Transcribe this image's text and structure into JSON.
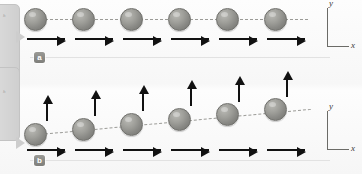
{
  "figure": {
    "background_color": "#fbfbfb",
    "ball_color": "#8a8a86",
    "arrow_color": "#111111",
    "axis_color": "#6b6b67",
    "trajectory_color": "#9b9b97",
    "badge_color": "#7e7e7a"
  },
  "launcher": {
    "label": "h"
  },
  "panels": [
    {
      "id": "a",
      "badge_label": "a",
      "axes": {
        "x_label": "x",
        "y_label": "y"
      },
      "trajectory": {
        "style": "dashed",
        "slope": "horizontal"
      },
      "balls": [
        {
          "index": 1,
          "x": 24,
          "y": 8
        },
        {
          "index": 2,
          "x": 72,
          "y": 8
        },
        {
          "index": 3,
          "x": 120,
          "y": 8
        },
        {
          "index": 4,
          "x": 168,
          "y": 8
        },
        {
          "index": 5,
          "x": 216,
          "y": 8
        },
        {
          "index": 6,
          "x": 264,
          "y": 8
        }
      ],
      "horizontal_arrows": [
        {
          "index": 1,
          "x": 27,
          "y": 38,
          "length": 38
        },
        {
          "index": 2,
          "x": 75,
          "y": 38,
          "length": 38
        },
        {
          "index": 3,
          "x": 123,
          "y": 38,
          "length": 38
        },
        {
          "index": 4,
          "x": 171,
          "y": 38,
          "length": 38
        },
        {
          "index": 5,
          "x": 219,
          "y": 38,
          "length": 38
        },
        {
          "index": 6,
          "x": 267,
          "y": 38,
          "length": 38
        }
      ],
      "vertical_arrows": []
    },
    {
      "id": "b",
      "badge_label": "b",
      "axes": {
        "x_label": "x",
        "y_label": "y"
      },
      "trajectory": {
        "style": "dashed",
        "slope": "rising"
      },
      "balls": [
        {
          "index": 1,
          "x": 24,
          "y": 36
        },
        {
          "index": 2,
          "x": 72,
          "y": 31
        },
        {
          "index": 3,
          "x": 120,
          "y": 26
        },
        {
          "index": 4,
          "x": 168,
          "y": 21
        },
        {
          "index": 5,
          "x": 216,
          "y": 16
        },
        {
          "index": 6,
          "x": 264,
          "y": 11
        }
      ],
      "horizontal_arrows": [
        {
          "index": 1,
          "x": 27,
          "y": 62,
          "length": 38
        },
        {
          "index": 2,
          "x": 75,
          "y": 62,
          "length": 38
        },
        {
          "index": 3,
          "x": 123,
          "y": 62,
          "length": 38
        },
        {
          "index": 4,
          "x": 171,
          "y": 62,
          "length": 38
        },
        {
          "index": 5,
          "x": 219,
          "y": 62,
          "length": 38
        },
        {
          "index": 6,
          "x": 267,
          "y": 62,
          "length": 38
        }
      ],
      "vertical_arrows": [
        {
          "index": 1,
          "x": 46,
          "y": 16,
          "length": 18
        },
        {
          "index": 2,
          "x": 94,
          "y": 11,
          "length": 18
        },
        {
          "index": 3,
          "x": 142,
          "y": 6,
          "length": 18
        },
        {
          "index": 4,
          "x": 190,
          "y": 1,
          "length": 18
        },
        {
          "index": 5,
          "x": 238,
          "y": -4,
          "length": 18
        },
        {
          "index": 6,
          "x": 286,
          "y": -9,
          "length": 18
        }
      ]
    }
  ]
}
